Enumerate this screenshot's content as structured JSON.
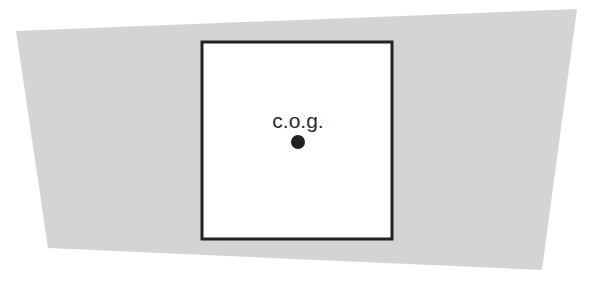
{
  "diagram": {
    "background_shape": {
      "type": "quadrilateral",
      "fill": "#d4d4d4",
      "points": [
        [
          16,
          31
        ],
        [
          577,
          9
        ],
        [
          542,
          270
        ],
        [
          48,
          248
        ]
      ]
    },
    "square": {
      "x": 202,
      "y": 42,
      "width": 190,
      "height": 197,
      "fill": "#ffffff",
      "stroke": "#222222",
      "stroke_width": 3
    },
    "center_of_gravity": {
      "label": "c.o.g.",
      "label_x": 298,
      "label_y": 128,
      "dot_cx": 298,
      "dot_cy": 142,
      "dot_r": 7,
      "dot_color": "#222222"
    }
  }
}
